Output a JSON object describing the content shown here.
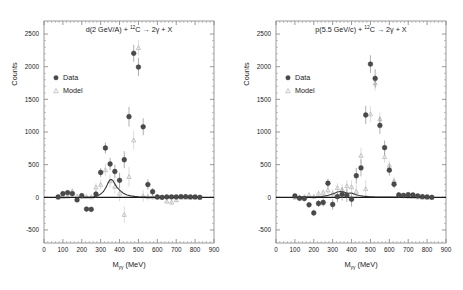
{
  "figure": {
    "width": 463,
    "height": 290,
    "background": "#ffffff",
    "data_color": "#4a4a4a",
    "model_color": "#b0b0b0",
    "axis_color": "#808080",
    "zero_line_color": "#1a1a1a"
  },
  "chart_data": [
    {
      "type": "scatter",
      "panel": "left",
      "title": "d(2 GeV/A) + ¹²C → 2γ + X",
      "title_parts": {
        "beam": "d(2 GeV/A) + ",
        "target_sup": "12",
        "target": "C ",
        "arrow": "→",
        "products": " 2γ + X"
      },
      "xlabel": "M",
      "xlabel_sub": "γγ",
      "xlabel_unit": " (MeV)",
      "ylabel": "Counts",
      "xlim": [
        0,
        900
      ],
      "ylim": [
        -700,
        2700
      ],
      "xticks": [
        0,
        100,
        200,
        300,
        400,
        500,
        600,
        700,
        800,
        900
      ],
      "yticks": [
        -500,
        0,
        500,
        1000,
        1500,
        2000,
        2500
      ],
      "grid": false,
      "legend_position": "upper-left",
      "legend": [
        {
          "label": "Data",
          "marker": "filled-circle"
        },
        {
          "label": "Model",
          "marker": "open-triangle"
        }
      ],
      "series": [
        {
          "name": "Data",
          "marker": "filled-circle",
          "x": [
            75,
            100,
            125,
            150,
            175,
            200,
            225,
            250,
            275,
            300,
            325,
            350,
            375,
            400,
            425,
            450,
            475,
            500,
            525,
            550,
            575,
            600,
            625,
            650,
            675,
            700,
            725,
            750,
            775,
            800,
            825
          ],
          "y": [
            5,
            55,
            70,
            55,
            -40,
            25,
            -180,
            -185,
            50,
            380,
            755,
            510,
            395,
            260,
            575,
            1235,
            2205,
            1995,
            1080,
            195,
            85,
            5,
            0,
            5,
            5,
            5,
            10,
            10,
            5,
            5,
            0
          ],
          "yerr": [
            20,
            25,
            28,
            28,
            30,
            32,
            40,
            42,
            55,
            70,
            85,
            95,
            105,
            115,
            130,
            150,
            130,
            140,
            130,
            80,
            55,
            40,
            30,
            25,
            22,
            20,
            18,
            18,
            16,
            15,
            14
          ]
        },
        {
          "name": "Model",
          "marker": "open-triangle",
          "x": [
            75,
            100,
            125,
            150,
            175,
            200,
            225,
            250,
            275,
            300,
            325,
            350,
            375,
            400,
            425,
            450,
            475,
            500,
            525,
            550,
            575,
            600,
            625,
            650,
            675,
            700,
            725,
            750,
            775,
            800,
            825
          ],
          "y": [
            0,
            10,
            15,
            95,
            20,
            10,
            10,
            5,
            155,
            195,
            420,
            250,
            165,
            60,
            -265,
            315,
            875,
            2290,
            20,
            10,
            5,
            0,
            0,
            -60,
            -75,
            -40,
            0,
            0,
            0,
            0,
            0
          ],
          "yerr": [
            15,
            18,
            20,
            40,
            25,
            25,
            30,
            35,
            60,
            80,
            95,
            100,
            110,
            120,
            130,
            150,
            145,
            120,
            90,
            60,
            45,
            35,
            28,
            40,
            45,
            35,
            20,
            18,
            16,
            15,
            14
          ]
        }
      ],
      "fit_curve": {
        "name": "Model fit",
        "x": [
          200,
          230,
          260,
          280,
          300,
          315,
          330,
          340,
          350,
          358,
          365,
          375,
          385,
          400,
          420,
          440,
          460,
          480,
          500,
          540,
          600,
          700,
          830
        ],
        "y": [
          0,
          0,
          5,
          18,
          50,
          90,
          160,
          225,
          268,
          272,
          255,
          205,
          160,
          110,
          62,
          36,
          22,
          14,
          9,
          4,
          1,
          0,
          0
        ]
      }
    },
    {
      "type": "scatter",
      "panel": "right",
      "title": "p(5.5 GeV/c) + ¹²C → 2γ + X",
      "title_parts": {
        "beam": "p(5.5 GeV/c) + ",
        "target_sup": "12",
        "target": "C ",
        "arrow": "→",
        "products": " 2γ + X"
      },
      "xlabel": "M",
      "xlabel_sub": "γγ",
      "xlabel_unit": " (MeV)",
      "ylabel": "Counts",
      "xlim": [
        0,
        900
      ],
      "ylim": [
        -700,
        2700
      ],
      "xticks": [
        0,
        100,
        200,
        300,
        400,
        500,
        600,
        700,
        800,
        900
      ],
      "yticks": [
        -500,
        0,
        500,
        1000,
        1500,
        2000,
        2500
      ],
      "grid": false,
      "legend_position": "upper-left",
      "legend": [
        {
          "label": "Data",
          "marker": "filled-circle"
        },
        {
          "label": "Model",
          "marker": "open-triangle"
        }
      ],
      "series": [
        {
          "name": "Data",
          "marker": "filled-circle",
          "x": [
            100,
            125,
            150,
            175,
            200,
            225,
            250,
            275,
            300,
            325,
            350,
            375,
            400,
            425,
            450,
            475,
            500,
            525,
            550,
            575,
            600,
            625,
            650,
            675,
            700,
            725,
            750,
            775,
            800,
            825
          ],
          "y": [
            20,
            -15,
            -20,
            -115,
            -240,
            -95,
            -80,
            215,
            -110,
            10,
            45,
            30,
            -30,
            330,
            450,
            1260,
            2040,
            1820,
            1100,
            760,
            415,
            200,
            35,
            30,
            40,
            35,
            20,
            10,
            5,
            0
          ],
          "yerr": [
            25,
            28,
            32,
            40,
            50,
            55,
            60,
            70,
            80,
            85,
            95,
            100,
            110,
            120,
            130,
            140,
            135,
            140,
            130,
            110,
            85,
            65,
            40,
            32,
            28,
            25,
            22,
            18,
            16,
            14
          ]
        },
        {
          "name": "Model",
          "marker": "open-triangle",
          "x": [
            100,
            125,
            150,
            175,
            200,
            225,
            250,
            275,
            300,
            325,
            350,
            375,
            400,
            425,
            450,
            475,
            500,
            525,
            550,
            575,
            600,
            625,
            650,
            675,
            700,
            725,
            750,
            775,
            800,
            825
          ],
          "y": [
            0,
            5,
            10,
            40,
            10,
            60,
            75,
            110,
            60,
            145,
            120,
            175,
            160,
            90,
            640,
            130,
            1275,
            1750,
            1200,
            620,
            490,
            255,
            40,
            20,
            15,
            10,
            5,
            0,
            0,
            0
          ],
          "yerr": [
            18,
            20,
            25,
            35,
            40,
            45,
            50,
            60,
            65,
            70,
            80,
            90,
            100,
            110,
            120,
            130,
            120,
            115,
            100,
            90,
            70,
            55,
            35,
            28,
            24,
            20,
            18,
            16,
            14,
            12
          ]
        }
      ],
      "fit_curve": {
        "name": "Model fit",
        "x": [
          100,
          160,
          200,
          240,
          270,
          290,
          310,
          325,
          340,
          350,
          360,
          372,
          385,
          395,
          405,
          420,
          440,
          460,
          490,
          530,
          600,
          700,
          830
        ],
        "y": [
          0,
          2,
          5,
          12,
          25,
          42,
          62,
          80,
          88,
          88,
          80,
          68,
          62,
          66,
          60,
          44,
          28,
          18,
          10,
          5,
          2,
          0,
          0
        ]
      }
    }
  ]
}
